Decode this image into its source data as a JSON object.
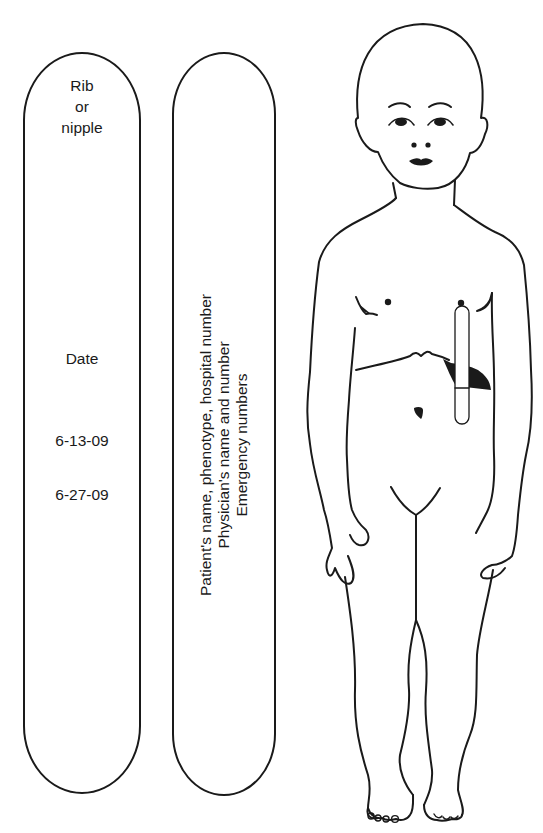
{
  "figure": {
    "type": "diagram"
  },
  "strip_left": {
    "header": [
      "Rib",
      "or",
      "nipple"
    ],
    "date_label": "Date",
    "dates": [
      "6-13-09",
      "6-27-09"
    ]
  },
  "strip_right": {
    "lines": [
      "Patient's name, phenotype, hospital number",
      "Physician's name and number",
      "Emergency numbers"
    ]
  },
  "colors": {
    "line": "#1a1a1a",
    "background": "#ffffff"
  }
}
